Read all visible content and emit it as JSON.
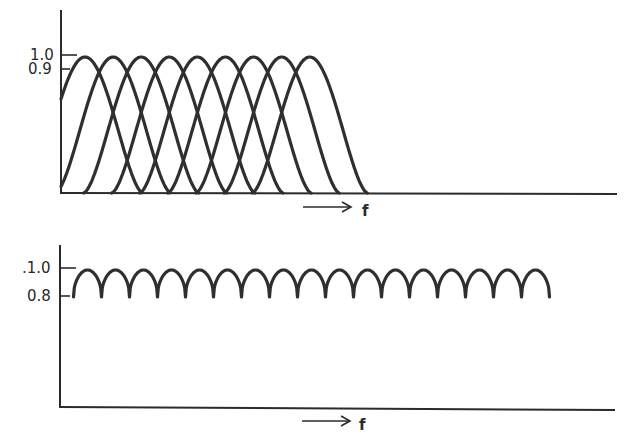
{
  "chart_data": [
    {
      "type": "line",
      "title": "",
      "description": "Overlapping bandpass filter bank responses (individual filters)",
      "xlabel": "f",
      "ylabel": "",
      "y_tick_labels": [
        "1.0",
        "0.9"
      ],
      "y_ticks": [
        1.0,
        0.9
      ],
      "num_filters": 17,
      "filter_center_positions": [
        1,
        2,
        3,
        4,
        5,
        6,
        7,
        8,
        9,
        10,
        11,
        12,
        13,
        14,
        15,
        16,
        17
      ],
      "peak_value": 1.0,
      "crossover_value": 0.9,
      "grid": false,
      "legend": null
    },
    {
      "type": "line",
      "title": "",
      "description": "Summed/combined response envelope of the filter bank",
      "xlabel": "f",
      "ylabel": "",
      "y_tick_labels": [
        ".1.0",
        "0.8"
      ],
      "y_ticks": [
        1.0,
        0.8
      ],
      "num_lobes": 17,
      "max_value": 1.0,
      "min_value": 0.8,
      "grid": false,
      "legend": null
    }
  ],
  "top_chart": {
    "tick_label_high": "1.0",
    "tick_label_low": "0.9",
    "x_axis_label": "f",
    "arrow": "→"
  },
  "bottom_chart": {
    "tick_label_high": ".1.0",
    "tick_label_low": "0.8",
    "x_axis_label": "f",
    "arrow": "→"
  }
}
